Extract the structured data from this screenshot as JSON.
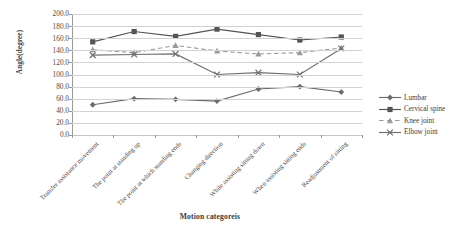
{
  "chart_data": {
    "type": "line",
    "title": "",
    "xlabel": "Motion categoreis",
    "ylabel": "Angle(degree)",
    "ylim": [
      0,
      200
    ],
    "ytick_step": 20,
    "grid": true,
    "legend_position": "right",
    "categories": [
      "Transfer assistance movement",
      "The point at standing up",
      "The point at which standing ends",
      "Changing direction",
      "While assisting sitting down",
      "When assisting sitting ends",
      "Readjustment of sitting"
    ],
    "yticks": [
      "0.0",
      "20.0",
      "40.0",
      "60.0",
      "80.0",
      "100.0",
      "120.0",
      "140.0",
      "160.0",
      "180.0",
      "200.0"
    ],
    "series": [
      {
        "name": "Lumbar",
        "marker": "diamond",
        "linestyle": "solid",
        "color": "#6b6b6b",
        "values": [
          50,
          60,
          59,
          56,
          76,
          80,
          71
        ]
      },
      {
        "name": "Cervical spine",
        "marker": "square",
        "linestyle": "solid",
        "color": "#545454",
        "values": [
          154,
          171,
          163,
          175,
          166,
          157,
          162
        ]
      },
      {
        "name": "Knee joint",
        "marker": "triangle",
        "linestyle": "dashed",
        "color": "#9a9a9a",
        "values": [
          141,
          136,
          148,
          139,
          134,
          136,
          144
        ]
      },
      {
        "name": "Elbow joint",
        "marker": "x",
        "linestyle": "solid",
        "color": "#6f6f6f",
        "values": [
          132,
          133,
          134,
          100,
          103,
          100,
          143
        ]
      }
    ]
  }
}
